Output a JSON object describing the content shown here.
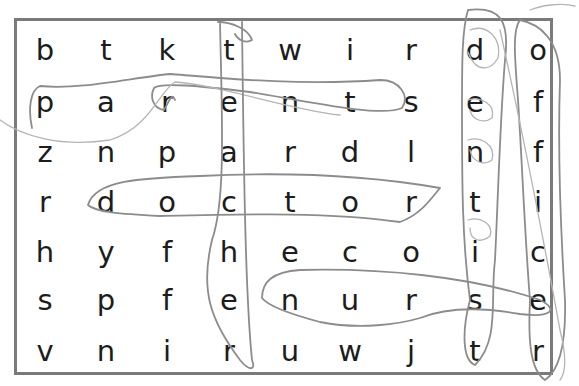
{
  "puzzle": {
    "type": "word-search",
    "columns": 9,
    "rows": 7,
    "grid": [
      [
        "b",
        "t",
        "k",
        "t",
        "w",
        "i",
        "r",
        "d",
        "o"
      ],
      [
        "p",
        "a",
        "r",
        "e",
        "n",
        "t",
        "s",
        "e",
        "f"
      ],
      [
        "z",
        "n",
        "p",
        "a",
        "r",
        "d",
        "l",
        "n",
        "f"
      ],
      [
        "r",
        "d",
        "o",
        "c",
        "t",
        "o",
        "r",
        "t",
        "i"
      ],
      [
        "h",
        "y",
        "f",
        "h",
        "e",
        "c",
        "o",
        "i",
        "c"
      ],
      [
        "s",
        "p",
        "f",
        "e",
        "n",
        "u",
        "r",
        "s",
        "e"
      ],
      [
        "v",
        "n",
        "i",
        "r",
        "u",
        "w",
        "j",
        "t",
        "r"
      ]
    ],
    "found_words": [
      {
        "word": "parents",
        "direction": "horizontal",
        "row": 2,
        "start_col": 1,
        "end_col": 7
      },
      {
        "word": "doctor",
        "direction": "horizontal",
        "row": 4,
        "start_col": 2,
        "end_col": 7
      },
      {
        "word": "nurse",
        "direction": "horizontal",
        "row": 6,
        "start_col": 5,
        "end_col": 9
      },
      {
        "word": "teacher",
        "direction": "vertical",
        "col": 4,
        "start_row": 1,
        "end_row": 7
      },
      {
        "word": "dentist",
        "direction": "vertical",
        "col": 8,
        "start_row": 1,
        "end_row": 7
      },
      {
        "word": "officer",
        "direction": "vertical",
        "col": 9,
        "start_row": 1,
        "end_row": 7
      }
    ],
    "colors": {
      "border": "#7a7a7a",
      "letters": "#1c1c1c",
      "pencil_marks": "#8c8c8c"
    }
  }
}
